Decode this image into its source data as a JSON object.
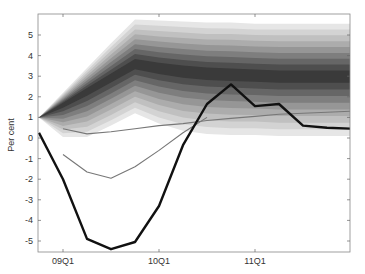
{
  "chart_data": {
    "type": "line",
    "title": "",
    "xlabel": "",
    "ylabel": "Per cent",
    "ylim": [
      -5.5,
      6.0
    ],
    "yticks": [
      5,
      4,
      3,
      2,
      1,
      0,
      -1,
      -2,
      -3,
      -4,
      -5
    ],
    "x": [
      "08Q4",
      "09Q1",
      "09Q2",
      "09Q3",
      "09Q4",
      "10Q1",
      "10Q2",
      "10Q3",
      "10Q4",
      "11Q1",
      "11Q2",
      "11Q3",
      "11Q4",
      "12Q1"
    ],
    "xtick_labels": [
      "09Q1",
      "10Q1",
      "11Q1"
    ],
    "grid": false,
    "legend": null,
    "series": [
      {
        "name": "Outturn (thick black)",
        "color": "#111111",
        "width": 2.4,
        "values": [
          0.25,
          -2.0,
          -4.9,
          -5.4,
          -5.05,
          -3.3,
          -0.35,
          1.65,
          2.6,
          1.55,
          1.65,
          0.6,
          0.5,
          0.45
        ]
      },
      {
        "name": "Earlier projection A (thin gray)",
        "color": "#777777",
        "width": 1.1,
        "values": [
          null,
          -0.8,
          -1.65,
          -1.95,
          -1.4,
          -0.6,
          0.25,
          1.0,
          null,
          null,
          null,
          null,
          null,
          null
        ]
      },
      {
        "name": "Earlier projection B (thin gray)",
        "color": "#777777",
        "width": 1.1,
        "values": [
          null,
          0.45,
          0.2,
          0.3,
          0.45,
          0.6,
          0.7,
          0.85,
          0.95,
          1.05,
          1.15,
          1.2,
          1.25,
          1.3
        ]
      }
    ],
    "fan": {
      "description": "Probability fan chart, shaded bands darkening toward the centre",
      "center": [
        1.0,
        1.65,
        2.3,
        2.95,
        3.6,
        3.4,
        3.25,
        3.15,
        3.1,
        3.05,
        3.0,
        3.0,
        3.0,
        3.0
      ],
      "outer_upper": [
        1.0,
        2.2,
        3.4,
        4.6,
        5.75,
        5.7,
        5.65,
        5.6,
        5.6,
        5.55,
        5.55,
        5.55,
        5.55,
        5.55
      ],
      "outer_lower": [
        1.0,
        0.05,
        0.05,
        0.6,
        1.2,
        0.7,
        0.35,
        0.2,
        0.15,
        0.15,
        0.1,
        0.1,
        0.1,
        0.1
      ],
      "bands": 9,
      "colors": [
        "#e6e6e6",
        "#d3d3d3",
        "#c0c0c0",
        "#acacac",
        "#969696",
        "#7e7e7e",
        "#666666",
        "#4e4e4e",
        "#3a3a3a"
      ]
    }
  },
  "axes": {
    "ylabel": "Per cent",
    "xticks": [
      "09Q1",
      "10Q1",
      "11Q1"
    ],
    "yticks": [
      "5",
      "4",
      "3",
      "2",
      "1",
      "0",
      "-1",
      "-2",
      "-3",
      "-4",
      "-5"
    ]
  }
}
